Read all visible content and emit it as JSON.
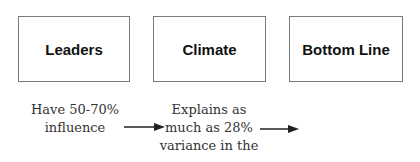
{
  "boxes": [
    {
      "label": "Leaders"
    },
    {
      "label": "Climate"
    },
    {
      "label": "Bottom Line"
    }
  ],
  "notes": [
    {
      "lines": [
        "Have 50-70%",
        "influence"
      ]
    },
    {
      "lines": [
        "Explains as",
        "much as 28%",
        "variance in the"
      ]
    }
  ]
}
